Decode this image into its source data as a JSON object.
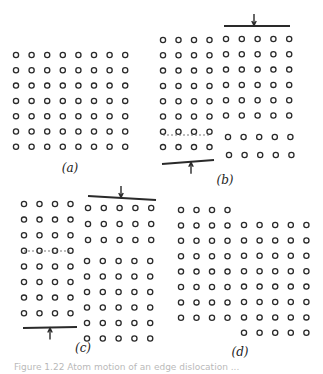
{
  "figure": {
    "panels": [
      {
        "id": "a",
        "label": "(a)",
        "label_pos": [
          70,
          168
        ],
        "blocks": [
          {
            "x0": 16,
            "y0": 55,
            "cols": 8,
            "rows": 7,
            "dx": 15.6,
            "dy": 15.3
          }
        ],
        "slip_planes": [],
        "bars": []
      },
      {
        "id": "b",
        "label": "(b)",
        "label_pos": [
          225,
          180
        ],
        "blocks": [
          {
            "x0": 163,
            "y0": 40,
            "cols": 4,
            "rows": 8,
            "dx": 15.5,
            "dy": 15.3
          },
          {
            "x0": 226,
            "y0": 39,
            "cols": 5,
            "rows": 6,
            "dx": 15.8,
            "dy": 15.3
          },
          {
            "x0": 228,
            "y0": 137,
            "cols": 5,
            "rows": 1,
            "dx": 15.6,
            "dy": 0
          },
          {
            "x0": 229,
            "y0": 155,
            "cols": 5,
            "rows": 1,
            "dx": 15.6,
            "dy": 0
          }
        ],
        "slip_planes": [
          {
            "x1": 163,
            "y1": 135,
            "x2": 210,
            "y2": 135
          }
        ],
        "bars": [
          {
            "x1": 224,
            "y1": 26,
            "x2": 290,
            "y2": 26,
            "arrow_x": 254,
            "arrow_dir": "down"
          },
          {
            "x1": 162,
            "y1": 164,
            "x2": 214,
            "y2": 160,
            "arrow_x": 191,
            "arrow_dir": "up"
          }
        ]
      },
      {
        "id": "c",
        "label": "(c)",
        "label_pos": [
          83,
          348
        ],
        "blocks": [
          {
            "x0": 24,
            "y0": 204,
            "cols": 4,
            "rows": 8,
            "dx": 15.5,
            "dy": 15.6
          }
        ],
        "extra_blocks": [
          {
            "x0": 88,
            "y0": 208,
            "cols": 5,
            "rows": 3,
            "dx": 15.8,
            "dy": 16
          },
          {
            "x0": 87,
            "y0": 261,
            "cols": 5,
            "rows": 6,
            "dx": 15.8,
            "dy": 15.5
          }
        ],
        "slip_planes": [
          {
            "x1": 24,
            "y1": 251,
            "x2": 71,
            "y2": 251
          }
        ],
        "bars": [
          {
            "x1": 88,
            "y1": 196,
            "x2": 156,
            "y2": 200,
            "arrow_x": 121,
            "arrow_dir": "down"
          },
          {
            "x1": 23,
            "y1": 328,
            "x2": 77,
            "y2": 327,
            "arrow_x": 50,
            "arrow_dir": "up"
          }
        ]
      },
      {
        "id": "d",
        "label": "(d)",
        "label_pos": [
          240,
          352
        ],
        "blocks": [
          {
            "x0": 181,
            "y0": 210,
            "cols": 4,
            "rows": 8,
            "dx": 15.5,
            "dy": 15.4
          },
          {
            "x0": 244,
            "y0": 225,
            "cols": 5,
            "rows": 8,
            "dx": 15.6,
            "dy": 15.4
          }
        ],
        "slip_planes": [],
        "bars": []
      }
    ],
    "colors": {
      "stroke": "#2a2a2a",
      "background": "#ffffff",
      "dashed": "#555555"
    },
    "caption": "Figure 1.22  Atom motion of an edge dislocation ..."
  }
}
